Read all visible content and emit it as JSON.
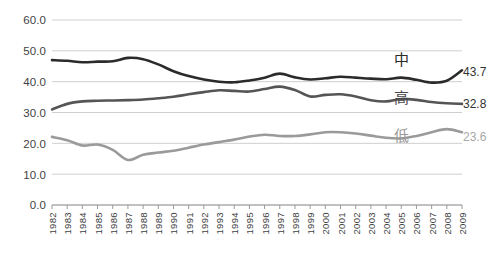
{
  "chart_data": {
    "type": "line",
    "title": "",
    "subtitle": "",
    "xlabel": "",
    "ylabel": "",
    "ylim": [
      0.0,
      60.0
    ],
    "yticks": [
      "0.0",
      "10.0",
      "20.0",
      "30.0",
      "40.0",
      "50.0",
      "60.0"
    ],
    "grid": true,
    "legend_position": "inline-right",
    "categories": [
      "1982",
      "1983",
      "1984",
      "1985",
      "1986",
      "1987",
      "1988",
      "1989",
      "1990",
      "1991",
      "1992",
      "1993",
      "1994",
      "1995",
      "1996",
      "1997",
      "1998",
      "1999",
      "2000",
      "2001",
      "2002",
      "2003",
      "2004",
      "2005",
      "2006",
      "2007",
      "2008",
      "2009"
    ],
    "series": [
      {
        "name": "中",
        "color": "#2b2b2b",
        "end_label": "43.7",
        "values": [
          47.0,
          46.8,
          46.3,
          46.5,
          46.6,
          47.7,
          47.3,
          45.6,
          43.4,
          41.8,
          40.7,
          40.0,
          39.8,
          40.4,
          41.3,
          42.6,
          41.4,
          40.7,
          41.1,
          41.6,
          41.3,
          41.0,
          40.8,
          41.3,
          40.6,
          39.7,
          40.3,
          43.7
        ]
      },
      {
        "name": "高",
        "color": "#555555",
        "end_label": "32.8",
        "values": [
          31.0,
          32.8,
          33.6,
          33.8,
          33.9,
          34.0,
          34.2,
          34.6,
          35.1,
          35.9,
          36.6,
          37.2,
          37.0,
          36.8,
          37.6,
          38.4,
          37.3,
          35.2,
          35.7,
          35.9,
          35.2,
          34.0,
          33.6,
          34.4,
          34.1,
          33.4,
          33.0,
          32.8
        ]
      },
      {
        "name": "低",
        "color": "#9a9a9a",
        "end_label": "23.6",
        "values": [
          22.1,
          21.0,
          19.3,
          19.6,
          17.9,
          14.6,
          16.3,
          17.0,
          17.6,
          18.6,
          19.6,
          20.4,
          21.2,
          22.2,
          22.8,
          22.4,
          22.4,
          22.9,
          23.6,
          23.6,
          23.2,
          22.5,
          21.8,
          21.6,
          22.4,
          23.6,
          24.6,
          23.6
        ]
      }
    ]
  }
}
